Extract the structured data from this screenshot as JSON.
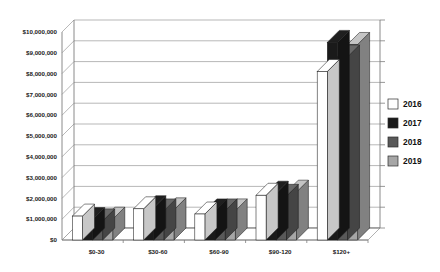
{
  "chart_data": {
    "type": "bar",
    "title": "",
    "subtitle": "",
    "xlabel": "",
    "ylabel": "",
    "categories": [
      "$0-30",
      "$30-60",
      "$60-90",
      "$90-120",
      "$120+"
    ],
    "series": [
      {
        "name": "2016",
        "color": "#ffffff",
        "values": [
          1150000,
          1500000,
          1250000,
          2150000,
          8100000
        ]
      },
      {
        "name": "2017",
        "color": "#1a1a1a",
        "values": [
          980000,
          1550000,
          1400000,
          2250000,
          9500000
        ]
      },
      {
        "name": "2018",
        "color": "#595959",
        "values": [
          920000,
          1400000,
          1400000,
          2100000,
          8800000
        ]
      },
      {
        "name": "2019",
        "color": "#a6a6a6",
        "values": [
          1000000,
          1450000,
          1400000,
          2300000,
          9400000
        ]
      }
    ],
    "ylim": [
      0,
      10000000
    ],
    "ytick_values": [
      0,
      1000000,
      2000000,
      3000000,
      4000000,
      5000000,
      6000000,
      7000000,
      8000000,
      9000000,
      10000000
    ],
    "ytick_labels": [
      "$0",
      "$1,000,000",
      "$2,000,000",
      "$3,000,000",
      "$4,000,000",
      "$5,000,000",
      "$6,000,000",
      "$7,000,000",
      "$8,000,000",
      "$9,000,000",
      "$10,000,000"
    ],
    "grid": true,
    "legend_position": "right",
    "three_d": true
  },
  "legend": {
    "entries": [
      {
        "label": "2016",
        "color": "#ffffff"
      },
      {
        "label": "2017",
        "color": "#1a1a1a"
      },
      {
        "label": "2018",
        "color": "#595959"
      },
      {
        "label": "2019",
        "color": "#a6a6a6"
      }
    ]
  }
}
